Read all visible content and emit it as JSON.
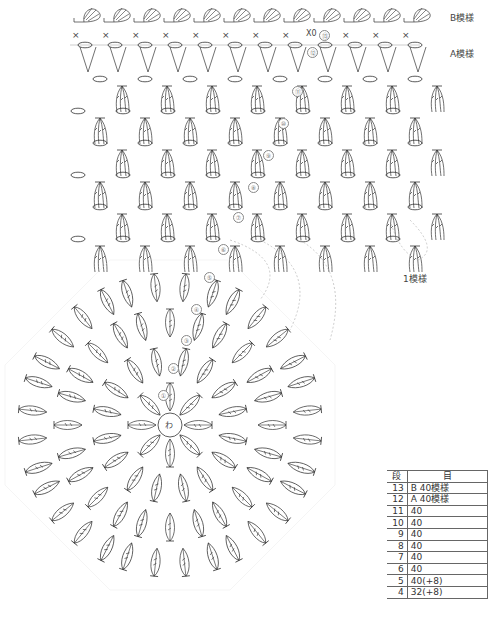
{
  "diagram": {
    "type": "crochet-chart",
    "labels": {
      "pattern_b": "B模様",
      "pattern_a": "A模様",
      "one_repeat": "1模様",
      "center_ring": "わ"
    },
    "row_markers": [
      "①",
      "②",
      "③",
      "④",
      "⑤",
      "⑥",
      "⑦",
      "⑧",
      "⑨",
      "⑩",
      "⑪",
      "⑫",
      "⑬"
    ],
    "row_marker_extra": "X0"
  },
  "table": {
    "headers": [
      "段",
      "目"
    ],
    "rows": [
      {
        "row": "13",
        "stitches": "B 40模様"
      },
      {
        "row": "12",
        "stitches": "A 40模様"
      },
      {
        "row": "11",
        "stitches": "40"
      },
      {
        "row": "10",
        "stitches": "40"
      },
      {
        "row": "9",
        "stitches": "40"
      },
      {
        "row": "8",
        "stitches": "40"
      },
      {
        "row": "7",
        "stitches": "40"
      },
      {
        "row": "6",
        "stitches": "40"
      },
      {
        "row": "5",
        "stitches": "40(+8)"
      },
      {
        "row": "4",
        "stitches": "32(+8)"
      }
    ]
  }
}
